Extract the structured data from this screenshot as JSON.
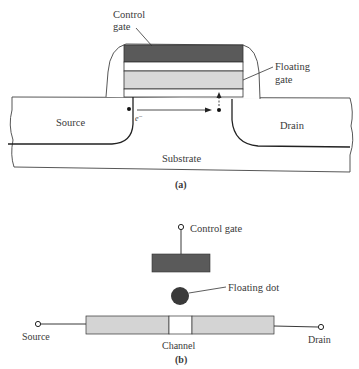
{
  "figure_a": {
    "caption": "(a)",
    "labels": {
      "control_gate_line1": "Control",
      "control_gate_line2": "gate",
      "floating_gate_line1": "Floating",
      "floating_gate_line2": "gate",
      "source": "Source",
      "drain": "Drain",
      "substrate": "Substrate",
      "electron": "e⁻"
    }
  },
  "figure_b": {
    "caption": "(b)",
    "labels": {
      "control_gate": "Control gate",
      "floating_dot": "Floating dot",
      "source": "Source",
      "drain": "Drain",
      "channel": "Channel"
    }
  },
  "colors": {
    "control_gate_fill": "#5a5a5a",
    "floating_gate_fill": "#d8d8d8",
    "channel_bar_fill": "#d4d4d4",
    "floating_dot_fill": "#3a3a3a",
    "line": "#2a2a2a"
  }
}
